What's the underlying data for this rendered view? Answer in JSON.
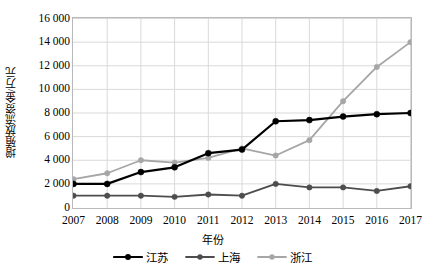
{
  "chart_data": {
    "type": "line",
    "title": "",
    "xlabel": "年份",
    "ylabel": "增殖放流资金/万元",
    "categories": [
      "2007",
      "2008",
      "2009",
      "2010",
      "2011",
      "2012",
      "2013",
      "2014",
      "2015",
      "2016",
      "2017"
    ],
    "x": [
      2007,
      2008,
      2009,
      2010,
      2011,
      2012,
      2013,
      2014,
      2015,
      2016,
      2017
    ],
    "ylim": [
      0,
      16000
    ],
    "xlim": [
      2007,
      2017
    ],
    "yticks": [
      0,
      2000,
      4000,
      6000,
      8000,
      10000,
      12000,
      14000,
      16000
    ],
    "ytick_labels": [
      "0",
      "2 000",
      "4 000",
      "6 000",
      "8 000",
      "10 000",
      "12 000",
      "14 000",
      "16 000"
    ],
    "grid": true,
    "grid_axis": "both",
    "grid_color": "#d9d9d9",
    "legend_position": "bottom",
    "series": [
      {
        "name": "江苏",
        "color": "#000000",
        "marker": "circle",
        "values": [
          2000,
          2000,
          3000,
          3400,
          4600,
          4900,
          7300,
          7400,
          7700,
          7900,
          8000
        ]
      },
      {
        "name": "上海",
        "color": "#4d4d4d",
        "marker": "circle",
        "values": [
          1000,
          1000,
          1000,
          900,
          1100,
          1000,
          2000,
          1700,
          1700,
          1400,
          1800
        ]
      },
      {
        "name": "浙江",
        "color": "#a6a6a6",
        "marker": "circle",
        "values": [
          2400,
          2900,
          4000,
          3800,
          4200,
          5000,
          4400,
          5700,
          9000,
          11900,
          14000
        ]
      }
    ]
  },
  "legend": {
    "items": [
      {
        "label": "江苏",
        "color": "#000000"
      },
      {
        "label": "上海",
        "color": "#4d4d4d"
      },
      {
        "label": "浙江",
        "color": "#a6a6a6"
      }
    ]
  }
}
